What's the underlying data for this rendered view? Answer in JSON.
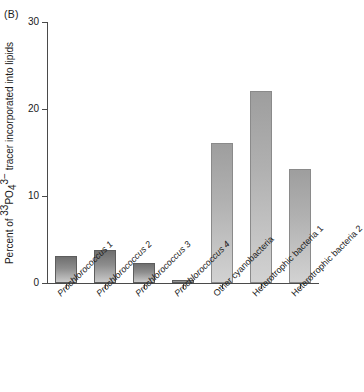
{
  "figure": {
    "panel_label": "(B)",
    "ylabel_prefix": "Percent of ",
    "ylabel_isotope": "33",
    "ylabel_element": "PO",
    "ylabel_sub": "4",
    "ylabel_charge": "3−",
    "ylabel_suffix": " tracer incorporated into lipids"
  },
  "chart_data": {
    "type": "bar",
    "title": "(B)",
    "xlabel": "",
    "ylabel": "Percent of 33PO43- tracer incorporated into lipids",
    "ylim": [
      0,
      30
    ],
    "yticks": [
      0,
      10,
      20,
      30
    ],
    "ytick_labels": [
      "0",
      "10",
      "20",
      "30"
    ],
    "grid": false,
    "legend": "none",
    "categories": [
      "Prochlorococcus 1",
      "Prochlorococcus 2",
      "Prochlorococcus 3",
      "Prochlorococcus 4",
      "Other cyanobacteria",
      "Heterotrophic bacteria 1",
      "Heterotrophic bacteria 2"
    ],
    "category_italic": [
      true,
      true,
      true,
      true,
      false,
      false,
      false
    ],
    "values": [
      3.1,
      3.8,
      2.3,
      0.4,
      16.1,
      22.1,
      13.1
    ],
    "bar_styles": [
      "dark",
      "dark",
      "dark",
      "dark",
      "light",
      "light",
      "light"
    ],
    "colors": {
      "bar_dark_top": "#6f6f6f",
      "bar_dark_bottom": "#c9c9c9",
      "bar_light_top": "#9e9e9e",
      "bar_light_bottom": "#d2d2d2",
      "axis": "#4a4a4a",
      "text": "#1a1a1a",
      "background": "#ffffff"
    }
  }
}
